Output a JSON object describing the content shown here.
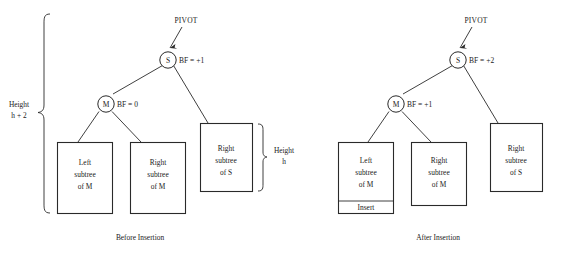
{
  "figure": {
    "colors": {
      "stroke": "#2a2a2a",
      "text": "#1a1a1a",
      "background": "#ffffff"
    }
  },
  "panels": [
    {
      "id": "before",
      "caption": "Before Insertion",
      "pivot_label": "PIVOT",
      "nodes": [
        {
          "id": "s",
          "label": "S",
          "bf_label": "BF = +1"
        },
        {
          "id": "m",
          "label": "M",
          "bf_label": "BF = 0"
        }
      ],
      "boxes": [
        {
          "id": "left-subtree-m",
          "line1": "Left",
          "line2": "subtree",
          "line3": "of M"
        },
        {
          "id": "right-subtree-m",
          "line1": "Right",
          "line2": "subtree",
          "line3": "of M"
        },
        {
          "id": "right-subtree-s",
          "line1": "Right",
          "line2": "subtree",
          "line3": "of S"
        }
      ],
      "braces": [
        {
          "id": "height-h-plus-2",
          "line1": "Height",
          "line2": "h + 2"
        },
        {
          "id": "height-h",
          "line1": "Height",
          "line2": "h"
        }
      ]
    },
    {
      "id": "after",
      "caption": "After Insertion",
      "pivot_label": "PIVOT",
      "nodes": [
        {
          "id": "s",
          "label": "S",
          "bf_label": "BF = +2"
        },
        {
          "id": "m",
          "label": "M",
          "bf_label": "BF = +1"
        }
      ],
      "boxes": [
        {
          "id": "left-subtree-m",
          "line1": "Left",
          "line2": "subtree",
          "line3": "of M",
          "insert_label": "Insert"
        },
        {
          "id": "right-subtree-m",
          "line1": "Right",
          "line2": "subtree",
          "line3": "of M"
        },
        {
          "id": "right-subtree-s",
          "line1": "Right",
          "line2": "subtree",
          "line3": "of S"
        }
      ]
    }
  ]
}
